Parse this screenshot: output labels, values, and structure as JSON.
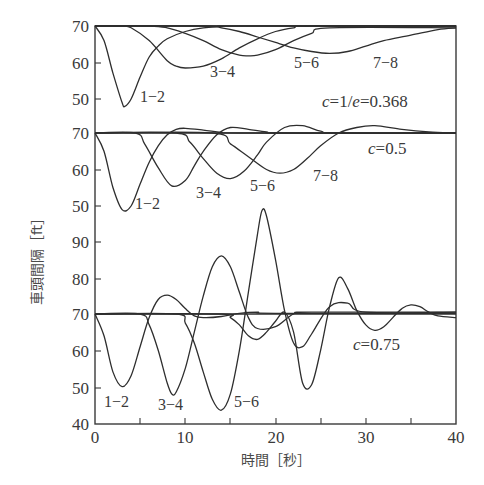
{
  "chart_data": {
    "type": "line",
    "title": "",
    "xlabel": "時間［秒］",
    "ylabel": "車頭間隔［ft］",
    "xlim": [
      0,
      40
    ],
    "x_ticks": [
      0,
      10,
      20,
      30,
      40
    ],
    "x_minor_ticks": [
      5,
      15,
      25,
      35
    ],
    "grid": false,
    "legend": "none (curves labeled inline)",
    "panels": [
      {
        "name": "c=1/e=0.368",
        "label": "c=1/e=0.368",
        "y_ticks": [
          70,
          60,
          50
        ],
        "baseline": 70,
        "series": [
          {
            "name": "1−2",
            "x": [
              0,
              1,
              2,
              3,
              3.3,
              4,
              5,
              6,
              7,
              8,
              10,
              12,
              14,
              16
            ],
            "values": [
              70,
              66,
              57,
              49,
              48,
              50,
              56,
              61.5,
              64.5,
              66.5,
              68.5,
              69.5,
              69.8,
              70
            ]
          },
          {
            "name": "3−4",
            "x": [
              0,
              3,
              4,
              6,
              8,
              9,
              10,
              12,
              14,
              16,
              18,
              20,
              22,
              24
            ],
            "values": [
              70,
              70,
              69.5,
              66,
              60.5,
              59,
              58.5,
              59,
              61,
              64,
              66.5,
              68.5,
              69.5,
              70
            ]
          },
          {
            "name": "5−6",
            "x": [
              0,
              6,
              8,
              10,
              12,
              14,
              16,
              17,
              18,
              20,
              22,
              24,
              26
            ],
            "values": [
              70,
              70,
              69.5,
              68,
              66,
              63.5,
              62,
              61.8,
              62,
              63.5,
              66,
              68,
              69.5
            ]
          },
          {
            "name": "7−8",
            "x": [
              0,
              12,
              14,
              16,
              18,
              20,
              22,
              24,
              26,
              28,
              30,
              32,
              35,
              38,
              40
            ],
            "values": [
              70,
              70,
              69.5,
              68.5,
              67,
              65.5,
              64,
              63,
              62.5,
              63,
              64.5,
              66,
              67.5,
              69,
              69.5
            ]
          }
        ],
        "annotations": [
          "1−2",
          "3−4",
          "5−6",
          "7−8",
          "c=1/e=0.368"
        ]
      },
      {
        "name": "c=0.5",
        "label": "c=0.5",
        "y_ticks": [
          70,
          60,
          50
        ],
        "baseline": 70,
        "series": [
          {
            "name": "1−2",
            "x": [
              0,
              1,
              2,
              3,
              4,
              5,
              6,
              7,
              8,
              9,
              10,
              12,
              14,
              16
            ],
            "values": [
              70,
              65,
              55,
              49,
              50,
              56,
              62,
              66.5,
              69.5,
              71,
              71.3,
              70.8,
              70.2,
              70
            ]
          },
          {
            "name": "3−4",
            "x": [
              0,
              4.5,
              5.5,
              7,
              8.5,
              10,
              11,
              12,
              13.5,
              15,
              17,
              19,
              21
            ],
            "values": [
              70,
              70,
              67,
              60.5,
              55.5,
              57,
              61,
              65,
              69.5,
              71.5,
              71,
              70.3,
              70
            ]
          },
          {
            "name": "5−6",
            "x": [
              0,
              9,
              10.5,
              12,
              13.5,
              15,
              16.5,
              18,
              19,
              21,
              23,
              25,
              27
            ],
            "values": [
              70,
              70,
              67.5,
              63,
              59,
              57.5,
              59.5,
              64,
              67.5,
              71.5,
              72,
              70.5,
              70
            ]
          },
          {
            "name": "7−8",
            "x": [
              0,
              13,
              15,
              17,
              19,
              20.5,
              22,
              23.5,
              25,
              27,
              29,
              31,
              34,
              37,
              40
            ],
            "values": [
              70,
              70,
              67,
              63.5,
              60,
              59,
              60,
              63,
              66.5,
              70,
              71.5,
              72,
              71,
              70.3,
              70
            ]
          }
        ],
        "annotations": [
          "1−2",
          "3−4",
          "5−6",
          "7−8",
          "c=0.5"
        ]
      },
      {
        "name": "c=0.75",
        "label": "c=0.75",
        "y_ticks": [
          90,
          80,
          70,
          60,
          50,
          40
        ],
        "baseline": 70,
        "series": [
          {
            "name": "1−2",
            "x": [
              0,
              1,
              2,
              3,
              4,
              5,
              6,
              7,
              8,
              9,
              10,
              11,
              12,
              14,
              16,
              18,
              20
            ],
            "values": [
              70,
              64,
              54,
              50,
              53,
              61,
              69,
              74,
              75.2,
              74,
              71.5,
              69.5,
              69,
              69.3,
              70.2,
              70.5,
              70.2
            ]
          },
          {
            "name": "3−4",
            "x": [
              0,
              5,
              6,
              7,
              8,
              8.5,
              9,
              10,
              11,
              12,
              13,
              14,
              15,
              16,
              17,
              18,
              20,
              22,
              24
            ],
            "values": [
              70,
              70,
              67,
              60,
              51,
              48,
              48.5,
              55,
              65,
              75,
              83,
              86,
              83,
              76,
              69,
              66,
              66.5,
              70,
              70.5
            ]
          },
          {
            "name": "5−6",
            "x": [
              0,
              9,
              10,
              11,
              12,
              13,
              14,
              15,
              16,
              17,
              18,
              18.5,
              19,
              20,
              21,
              22,
              23,
              24,
              26,
              28,
              30
            ],
            "values": [
              70,
              70,
              67.5,
              62,
              54,
              46.5,
              43.5,
              48,
              60,
              76,
              92,
              98.5,
              97,
              85,
              71,
              62,
              61,
              64.5,
              72,
              73,
              70.5
            ]
          },
          {
            "name": "7−8",
            "x": [
              0,
              14,
              15,
              16,
              17,
              18,
              19,
              20,
              21,
              22,
              23,
              24,
              25,
              26,
              27,
              28,
              29,
              30,
              31,
              32,
              33,
              34,
              35,
              36,
              37,
              38,
              40
            ],
            "values": [
              70,
              70,
              69,
              67,
              64,
              63,
              65,
              68,
              70.5,
              65,
              51,
              50.5,
              60,
              72,
              80,
              77,
              71,
              67,
              65.5,
              66.5,
              69,
              71.5,
              72.5,
              72,
              70.5,
              69.5,
              69
            ]
          }
        ],
        "annotations": [
          "1−2",
          "3−4",
          "5−6",
          "c=0.75"
        ]
      }
    ]
  },
  "axes": {
    "x_tick_labels": [
      "0",
      "10",
      "20",
      "30",
      "40"
    ],
    "y_tick_labels": [
      "70",
      "60",
      "50",
      "70",
      "60",
      "50",
      "90",
      "80",
      "70",
      "60",
      "50",
      "40"
    ],
    "xlabel": "時間［秒］",
    "ylabel": "車頭間隔［ft］"
  },
  "labels": {
    "p1": {
      "a": "1−2",
      "b": "3−4",
      "c": "5−6",
      "d": "7−8",
      "c_prefix": "c",
      "c_text": "=1/",
      "c_e": "e",
      "c_value": "=0.368"
    },
    "p2": {
      "a": "1−2",
      "b": "3−4",
      "c": "5−6",
      "d": "7−8",
      "c_prefix": "c",
      "c_value": "=0.5"
    },
    "p3": {
      "a": "1−2",
      "b": "3−4",
      "c": "5−6",
      "c_prefix": "c",
      "c_value": "=0.75"
    }
  }
}
